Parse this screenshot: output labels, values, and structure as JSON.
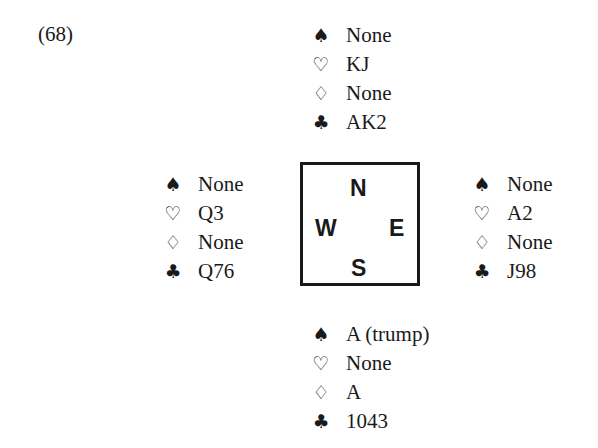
{
  "problem": {
    "number": "(68)"
  },
  "suit_icons": {
    "spades": "♠",
    "hearts": "♡",
    "diamonds": "♢",
    "clubs": "♣"
  },
  "compass": {
    "north": "N",
    "west": "W",
    "east": "E",
    "south": "S"
  },
  "hands": {
    "north": {
      "spades": "None",
      "hearts": "KJ",
      "diamonds": "None",
      "clubs": "AK2"
    },
    "west": {
      "spades": "None",
      "hearts": "Q3",
      "diamonds": "None",
      "clubs": "Q76"
    },
    "east": {
      "spades": "None",
      "hearts": "A2",
      "diamonds": "None",
      "clubs": "J98"
    },
    "south": {
      "spades": "A (trump)",
      "hearts": "None",
      "diamonds": "A",
      "clubs": "1043"
    }
  }
}
